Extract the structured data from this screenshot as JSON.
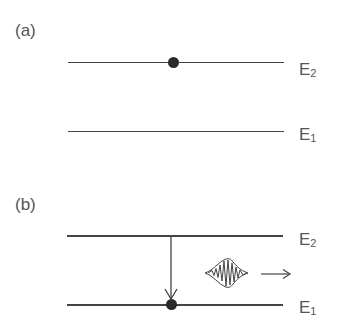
{
  "panels": [
    {
      "label": "(a)",
      "description": "Electron in excited state E2",
      "levels": [
        {
          "name": "E",
          "sub": "2"
        },
        {
          "name": "E",
          "sub": "1"
        }
      ],
      "electron_level": "E2"
    },
    {
      "label": "(b)",
      "description": "Electron transitions from E2 to E1 emitting a photon wave packet",
      "levels": [
        {
          "name": "E",
          "sub": "2"
        },
        {
          "name": "E",
          "sub": "1"
        }
      ],
      "electron_level": "E1",
      "transition": "E2 -> E1",
      "emission": "photon-wave-packet",
      "emission_direction": "right"
    }
  ],
  "colors": {
    "line": "#444444",
    "electron": "#2a2a2a",
    "text": "#555555"
  }
}
